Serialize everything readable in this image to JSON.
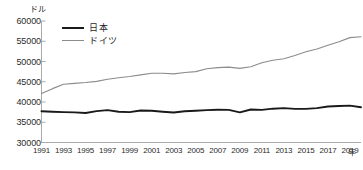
{
  "chart_data": {
    "type": "line",
    "title": "",
    "subtitle": "",
    "xlabel": "年",
    "ylabel": "ドル",
    "yunit": "ドル",
    "xunit": "年",
    "xlim": [
      1991,
      2020
    ],
    "ylim": [
      30000,
      60000
    ],
    "ytick_values": [
      60000,
      55000,
      50000,
      45000,
      40000,
      35000,
      30000
    ],
    "ytick_labels": [
      "60000",
      "55000",
      "50000",
      "45000",
      "40000",
      "35000",
      "30000"
    ],
    "xtick_values": [
      1991,
      1993,
      1995,
      1997,
      1999,
      2001,
      2003,
      2005,
      2007,
      2009,
      2011,
      2013,
      2015,
      2017,
      2019
    ],
    "xtick_labels": [
      "1991",
      "1993",
      "1995",
      "1997",
      "1999",
      "2001",
      "2003",
      "2005",
      "2007",
      "2009",
      "2011",
      "2013",
      "2015",
      "2017",
      "2019"
    ],
    "grid": false,
    "legend_position": "top-left",
    "x": [
      1991,
      1992,
      1993,
      1994,
      1995,
      1996,
      1997,
      1998,
      1999,
      2000,
      2001,
      2002,
      2003,
      2004,
      2005,
      2006,
      2007,
      2008,
      2009,
      2010,
      2011,
      2012,
      2013,
      2014,
      2015,
      2016,
      2017,
      2018,
      2019,
      2020
    ],
    "series": [
      {
        "name": "日本",
        "color": "#1a1a1a",
        "width": 1.9,
        "values": [
          37700,
          37600,
          37500,
          37450,
          37300,
          37750,
          38000,
          37600,
          37500,
          37900,
          37850,
          37600,
          37400,
          37700,
          37850,
          38000,
          38100,
          38050,
          37450,
          38150,
          38050,
          38350,
          38500,
          38300,
          38300,
          38500,
          38900,
          39000,
          39100,
          38700
        ]
      },
      {
        "name": "ドイツ",
        "color": "#8c8c8c",
        "width": 1.1,
        "values": [
          42100,
          43300,
          44400,
          44600,
          44800,
          45100,
          45600,
          46000,
          46300,
          46700,
          47100,
          47100,
          46950,
          47300,
          47500,
          48200,
          48500,
          48600,
          48300,
          48700,
          49700,
          50300,
          50700,
          51500,
          52400,
          53100,
          54000,
          54900,
          55900,
          56100
        ]
      }
    ]
  },
  "legend": {
    "items": [
      {
        "label": "日本",
        "style": "jp"
      },
      {
        "label": "ドイツ",
        "style": "de"
      }
    ]
  },
  "axes": {
    "yunit_label": "ドル",
    "xunit_label": "年"
  }
}
